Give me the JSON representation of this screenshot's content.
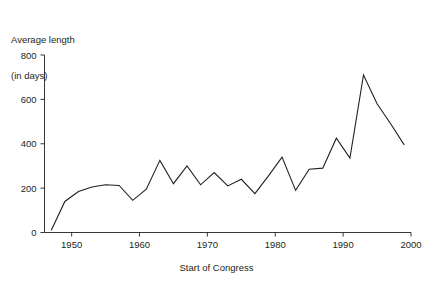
{
  "chart_data": {
    "type": "line",
    "title": "",
    "ylabel": "Average length\n(in days)",
    "ylabel_line1": "Average length",
    "ylabel_line2": "(in days)",
    "xlabel": "Start of Congress",
    "xlim": [
      1946,
      2000
    ],
    "ylim": [
      0,
      800
    ],
    "yticks": [
      0,
      200,
      400,
      600,
      800
    ],
    "ytick_labels": [
      "0",
      "200",
      "400",
      "600",
      "800"
    ],
    "xticks": [
      1950,
      1960,
      1970,
      1980,
      1990,
      2000
    ],
    "xtick_labels": [
      "1950",
      "1960",
      "1970",
      "1980",
      "1990",
      "2000"
    ],
    "grid": false,
    "legend": null,
    "line_color": "#231f20",
    "x": [
      1947,
      1949,
      1951,
      1953,
      1955,
      1957,
      1959,
      1961,
      1963,
      1965,
      1967,
      1969,
      1971,
      1973,
      1975,
      1977,
      1979,
      1981,
      1983,
      1985,
      1987,
      1989,
      1991,
      1993,
      1995,
      1997,
      1999
    ],
    "values": [
      10,
      140,
      185,
      205,
      215,
      212,
      145,
      195,
      325,
      220,
      300,
      215,
      270,
      210,
      240,
      175,
      255,
      340,
      190,
      285,
      290,
      425,
      335,
      710,
      580,
      490,
      395
    ],
    "series": [
      {
        "name": "Average length of Congress (in days)",
        "values": [
          10,
          140,
          185,
          205,
          215,
          212,
          145,
          195,
          325,
          220,
          300,
          215,
          270,
          210,
          240,
          175,
          255,
          340,
          190,
          285,
          290,
          425,
          335,
          710,
          580,
          490,
          395
        ]
      }
    ]
  }
}
